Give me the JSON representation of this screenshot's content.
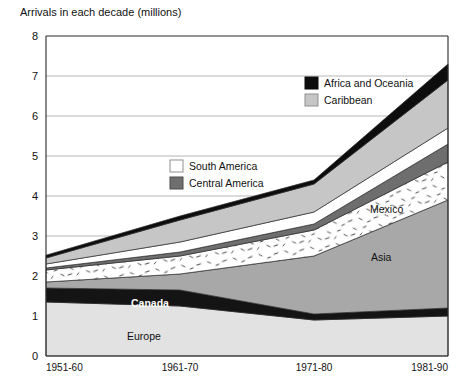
{
  "chart_data": {
    "type": "area",
    "title": "Arrivals in each decade (millions)",
    "xlabel": "",
    "ylabel": "",
    "ylim": [
      0,
      8
    ],
    "yticks": [
      0,
      1,
      2,
      3,
      4,
      5,
      6,
      7,
      8
    ],
    "ytick_labels": [
      "0",
      "1",
      "2",
      "3",
      "4",
      "5",
      "6",
      "7",
      "8"
    ],
    "grid": true,
    "stacked": true,
    "legend_position": "inside-upper-right",
    "categories": [
      "1951-60",
      "1961-70",
      "1971-80",
      "1981-90"
    ],
    "series": [
      {
        "name": "Europe",
        "values": [
          1.35,
          1.25,
          0.9,
          1.0
        ],
        "color": "#e2e2e2",
        "pattern": "solid"
      },
      {
        "name": "Canada",
        "values": [
          0.35,
          0.4,
          0.15,
          0.2
        ],
        "color": "#141414",
        "pattern": "solid"
      },
      {
        "name": "Asia",
        "values": [
          0.15,
          0.4,
          1.45,
          2.7
        ],
        "color": "#a8a8a8",
        "pattern": "solid"
      },
      {
        "name": "Mexico",
        "values": [
          0.3,
          0.45,
          0.65,
          0.95
        ],
        "color": "#ffffff",
        "pattern": "speckle"
      },
      {
        "name": "Central America",
        "values": [
          0.05,
          0.1,
          0.15,
          0.45
        ],
        "color": "#6e6e6e",
        "pattern": "solid"
      },
      {
        "name": "South America",
        "values": [
          0.1,
          0.25,
          0.3,
          0.4
        ],
        "color": "#ffffff",
        "pattern": "solid"
      },
      {
        "name": "Caribbean",
        "values": [
          0.15,
          0.55,
          0.7,
          1.2
        ],
        "color": "#c6c6c6",
        "pattern": "solid"
      },
      {
        "name": "Africa and Oceania",
        "values": [
          0.07,
          0.1,
          0.1,
          0.4
        ],
        "color": "#0d0d0d",
        "pattern": "solid"
      }
    ],
    "totals": [
      2.42,
      3.5,
      4.4,
      7.3
    ],
    "annotations": [
      {
        "text": "Mexico",
        "series": "Mexico",
        "style": "dark"
      },
      {
        "text": "Asia",
        "series": "Asia",
        "style": "dark"
      },
      {
        "text": "Canada",
        "series": "Canada",
        "style": "light"
      },
      {
        "text": "Europe",
        "series": "Europe",
        "style": "dark"
      }
    ]
  },
  "legend": {
    "boxes": [
      {
        "label": "Africa and Oceania",
        "swatch": "#0d0d0d",
        "border": "#0d0d0d"
      },
      {
        "label": "Caribbean",
        "swatch": "#c6c6c6",
        "border": "#8f8f8f"
      },
      {
        "label": "South America",
        "swatch": "#ffffff",
        "border": "#8f8f8f"
      },
      {
        "label": "Central America",
        "swatch": "#6e6e6e",
        "border": "#4d4d4d"
      }
    ]
  },
  "axis": {
    "x_labels": [
      "1951-60",
      "1961-70",
      "1971-80",
      "1981-90"
    ],
    "y_labels": [
      "8",
      "7",
      "6",
      "5",
      "4",
      "3",
      "2",
      "1",
      "0"
    ]
  },
  "colors": {
    "plot_border": "#2b2b2b",
    "gridline": "#9a9a9a",
    "background": "#ffffff"
  }
}
